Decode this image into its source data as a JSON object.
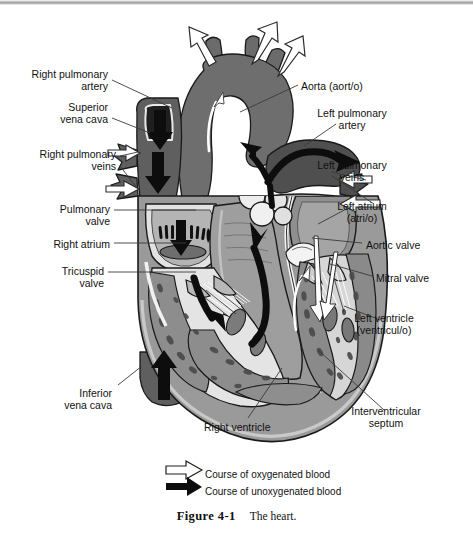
{
  "figure": {
    "number": "Figure 4-1",
    "caption": "The heart."
  },
  "labels": [
    {
      "name": "right-pulmonary-artery",
      "text": "Right pulmonary\nartery",
      "x": 108,
      "y": 68,
      "align": "right"
    },
    {
      "name": "superior-vena-cava",
      "text": "Superior\nvena cava",
      "x": 108,
      "y": 101,
      "align": "right"
    },
    {
      "name": "right-pulmonary-veins",
      "text": "Right pulmonary\nveins",
      "x": 116,
      "y": 148,
      "align": "right"
    },
    {
      "name": "pulmonary-valve",
      "text": "Pulmonary\nvalve",
      "x": 110,
      "y": 203,
      "align": "right"
    },
    {
      "name": "right-atrium",
      "text": "Right atrium",
      "x": 110,
      "y": 238,
      "align": "right"
    },
    {
      "name": "tricuspid-valve",
      "text": "Tricuspid\nvalve",
      "x": 104,
      "y": 265,
      "align": "right"
    },
    {
      "name": "inferior-vena-cava",
      "text": "Inferior\nvena cava",
      "x": 112,
      "y": 387,
      "align": "right"
    },
    {
      "name": "right-ventricle",
      "text": "Right ventricle",
      "x": 204,
      "y": 421,
      "align": "left"
    },
    {
      "name": "aorta",
      "text": "Aorta (aort/o)",
      "x": 301,
      "y": 80,
      "align": "left"
    },
    {
      "name": "left-pulmonary-artery",
      "text": "Left pulmonary\nartery",
      "x": 352,
      "y": 107,
      "align": "center"
    },
    {
      "name": "left-pulmonary-veins",
      "text": "Left pulmonary\nveins",
      "x": 352,
      "y": 159,
      "align": "center"
    },
    {
      "name": "left-atrium",
      "text": "Left atrium\n(atri/o)",
      "x": 362,
      "y": 200,
      "align": "center"
    },
    {
      "name": "aortic-valve",
      "text": "Aortic valve",
      "x": 366,
      "y": 239,
      "align": "left"
    },
    {
      "name": "mitral-valve",
      "text": "Mitral valve",
      "x": 376,
      "y": 272,
      "align": "left"
    },
    {
      "name": "left-ventricle",
      "text": "Left ventricle\n(ventricul/o)",
      "x": 384,
      "y": 312,
      "align": "center"
    },
    {
      "name": "interventricular-septum",
      "text": "Interventricular\nseptum",
      "x": 386,
      "y": 405,
      "align": "center"
    }
  ],
  "legend": {
    "oxygenated": {
      "label": "Course of oxygenated blood",
      "icon": "hollow-arrow-right",
      "x": 205,
      "y": 469
    },
    "unoxygenated": {
      "label": "Course of unoxygenated blood",
      "icon": "solid-arrow-right",
      "x": 205,
      "y": 486
    }
  },
  "colors": {
    "outline": "#1a1a1a",
    "vessel_dark": "#5e5e5e",
    "vessel_mid": "#6e6e6e",
    "myocardium": "#9a9a9a",
    "myocardium_dark": "#7d7d7d",
    "chamber_light": "#e2e2e2",
    "chamber_mid": "#c7c7c7",
    "valve_white": "#f2f2f2",
    "arrow_dark": "#111111",
    "arrow_light": "#ffffff",
    "background": "#ffffff",
    "leader": "#3a3a3a"
  }
}
